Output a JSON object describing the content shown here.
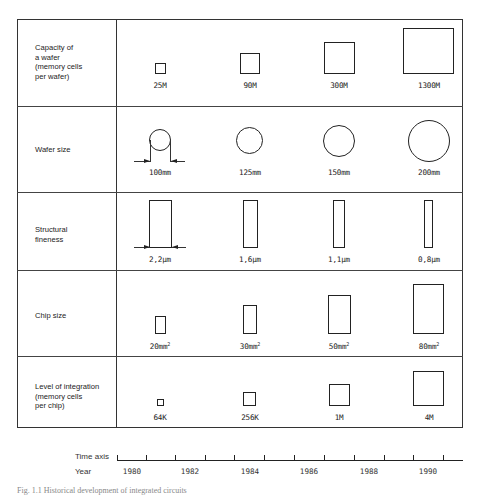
{
  "rows": [
    {
      "label": "Capacity of\na wafer\n(memory cells\nper wafer)",
      "values": [
        "25M",
        "90M",
        "300M",
        "1300M"
      ],
      "shape": "square"
    },
    {
      "label": "Wafer size",
      "values": [
        "100mm",
        "125mm",
        "150mm",
        "200mm"
      ],
      "shape": "circle"
    },
    {
      "label": "Structural\nfineness",
      "values": [
        "2,2µm",
        "1,6µm",
        "1,1µm",
        "0,8µm"
      ],
      "shape": "tall-rectangle"
    },
    {
      "label": "Chip size",
      "values": [
        "20mm",
        "30mm",
        "50mm",
        "80mm"
      ],
      "unit_superscript": "2",
      "shape": "rectangle"
    },
    {
      "label": "Level of integration\n(memory cells\nper chip)",
      "values": [
        "64K",
        "256K",
        "1M",
        "4M"
      ],
      "shape": "square"
    }
  ],
  "time_axis": {
    "axis_label": "Time axis",
    "year_label": "Year",
    "years": [
      "1980",
      "1982",
      "1984",
      "1986",
      "1988",
      "1990"
    ]
  },
  "caption": "Fig. 1.1   Historical development of integrated circuits"
}
